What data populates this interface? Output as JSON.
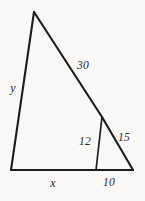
{
  "figure": {
    "kind": "geometry-diagram",
    "background_color": "#f9f8f7",
    "line_color": "#1d1d1d",
    "label_color": "#2a2a2a",
    "canvas": {
      "width": 145,
      "height": 201
    },
    "vertices": {
      "apex": {
        "x": 34,
        "y": 12
      },
      "bottom_left": {
        "x": 11,
        "y": 170
      },
      "bottom_right": {
        "x": 133,
        "y": 170
      },
      "hypotenuse_point": {
        "x": 102,
        "y": 117
      },
      "base_point": {
        "x": 96,
        "y": 170
      }
    },
    "segments": [
      {
        "name": "left-side",
        "from": "apex",
        "to": "bottom_left",
        "label": "y"
      },
      {
        "name": "base",
        "from": "bottom_left",
        "to": "bottom_right",
        "label": ""
      },
      {
        "name": "upper-hypotenuse",
        "from": "apex",
        "to": "hypotenuse_point",
        "label": "30"
      },
      {
        "name": "lower-hypotenuse",
        "from": "hypotenuse_point",
        "to": "bottom_right",
        "label": "15"
      },
      {
        "name": "inner-segment",
        "from": "hypotenuse_point",
        "to": "base_point",
        "label": "12"
      },
      {
        "name": "base-left-part",
        "from": "bottom_left",
        "to": "base_point",
        "label": "x"
      },
      {
        "name": "base-right-part",
        "from": "base_point",
        "to": "bottom_right",
        "label": "10"
      }
    ],
    "labels": [
      {
        "id": "label-y",
        "text": "y",
        "x": 13,
        "y": 88,
        "style": "var"
      },
      {
        "id": "label-30",
        "text": "30",
        "x": 83,
        "y": 66,
        "style": "num"
      },
      {
        "id": "label-12",
        "text": "12",
        "x": 85,
        "y": 142,
        "style": "num"
      },
      {
        "id": "label-15",
        "text": "15",
        "x": 124,
        "y": 138,
        "style": "num"
      },
      {
        "id": "label-x",
        "text": "x",
        "x": 53,
        "y": 183,
        "style": "var"
      },
      {
        "id": "label-10",
        "text": "10",
        "x": 109,
        "y": 183,
        "style": "num"
      }
    ]
  }
}
